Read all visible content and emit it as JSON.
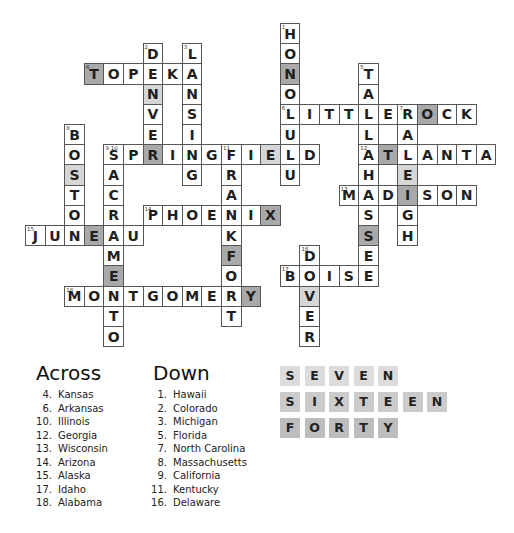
{
  "puzzle": {
    "grid": {
      "origin_x": 25,
      "origin_y": 23,
      "cell_w": 19.6,
      "cell_h": 20.2,
      "shade_colors": {
        "dark": "#a9a9a9",
        "light": "#d6d6d6",
        "none": "#ffffff"
      },
      "cells": [
        {
          "c": 13,
          "r": 0,
          "ch": "H",
          "num": "1"
        },
        {
          "c": 13,
          "r": 1,
          "ch": "O"
        },
        {
          "c": 13,
          "r": 2,
          "ch": "N",
          "shade": "dark"
        },
        {
          "c": 13,
          "r": 3,
          "ch": "O"
        },
        {
          "c": 13,
          "r": 4,
          "ch": "L",
          "num": "6"
        },
        {
          "c": 13,
          "r": 5,
          "ch": "U"
        },
        {
          "c": 13,
          "r": 6,
          "ch": "L"
        },
        {
          "c": 13,
          "r": 7,
          "ch": "U"
        },
        {
          "c": 6,
          "r": 1,
          "ch": "D",
          "num": "2"
        },
        {
          "c": 6,
          "r": 2,
          "ch": "E"
        },
        {
          "c": 6,
          "r": 3,
          "ch": "N",
          "shade": "light"
        },
        {
          "c": 6,
          "r": 4,
          "ch": "V"
        },
        {
          "c": 6,
          "r": 5,
          "ch": "E"
        },
        {
          "c": 6,
          "r": 6,
          "ch": "R",
          "shade": "dark"
        },
        {
          "c": 8,
          "r": 1,
          "ch": "L",
          "num": "3"
        },
        {
          "c": 8,
          "r": 2,
          "ch": "A"
        },
        {
          "c": 8,
          "r": 3,
          "ch": "N"
        },
        {
          "c": 8,
          "r": 4,
          "ch": "S"
        },
        {
          "c": 8,
          "r": 5,
          "ch": "I"
        },
        {
          "c": 8,
          "r": 6,
          "ch": "N"
        },
        {
          "c": 8,
          "r": 7,
          "ch": "G"
        },
        {
          "c": 3,
          "r": 2,
          "ch": "T",
          "num": "4",
          "shade": "dark"
        },
        {
          "c": 4,
          "r": 2,
          "ch": "O"
        },
        {
          "c": 5,
          "r": 2,
          "ch": "P"
        },
        {
          "c": 7,
          "r": 2,
          "ch": "K"
        },
        {
          "c": 17,
          "r": 2,
          "ch": "T",
          "num": "5"
        },
        {
          "c": 17,
          "r": 3,
          "ch": "A"
        },
        {
          "c": 17,
          "r": 4,
          "ch": "L"
        },
        {
          "c": 17,
          "r": 5,
          "ch": "L"
        },
        {
          "c": 17,
          "r": 6,
          "ch": "A",
          "num": "12"
        },
        {
          "c": 17,
          "r": 7,
          "ch": "H"
        },
        {
          "c": 17,
          "r": 8,
          "ch": "A"
        },
        {
          "c": 17,
          "r": 9,
          "ch": "S"
        },
        {
          "c": 17,
          "r": 10,
          "ch": "S",
          "shade": "dark"
        },
        {
          "c": 17,
          "r": 11,
          "ch": "E"
        },
        {
          "c": 17,
          "r": 12,
          "ch": "E"
        },
        {
          "c": 14,
          "r": 4,
          "ch": "I"
        },
        {
          "c": 15,
          "r": 4,
          "ch": "T"
        },
        {
          "c": 16,
          "r": 4,
          "ch": "T"
        },
        {
          "c": 18,
          "r": 4,
          "ch": "E"
        },
        {
          "c": 19,
          "r": 4,
          "ch": "R",
          "num": "7"
        },
        {
          "c": 20,
          "r": 4,
          "ch": "O",
          "shade": "dark"
        },
        {
          "c": 21,
          "r": 4,
          "ch": "C"
        },
        {
          "c": 22,
          "r": 4,
          "ch": "K"
        },
        {
          "c": 19,
          "r": 5,
          "ch": "A"
        },
        {
          "c": 19,
          "r": 6,
          "ch": "L"
        },
        {
          "c": 19,
          "r": 7,
          "ch": "E",
          "shade": "light"
        },
        {
          "c": 19,
          "r": 8,
          "ch": "I",
          "shade": "dark"
        },
        {
          "c": 19,
          "r": 9,
          "ch": "G"
        },
        {
          "c": 19,
          "r": 10,
          "ch": "H"
        },
        {
          "c": 2,
          "r": 5,
          "ch": "B",
          "num": "8"
        },
        {
          "c": 2,
          "r": 6,
          "ch": "O"
        },
        {
          "c": 2,
          "r": 7,
          "ch": "S",
          "shade": "light"
        },
        {
          "c": 2,
          "r": 8,
          "ch": "T"
        },
        {
          "c": 2,
          "r": 9,
          "ch": "O"
        },
        {
          "c": 2,
          "r": 10,
          "ch": "N"
        },
        {
          "c": 4,
          "r": 6,
          "ch": "S",
          "num": "9 10"
        },
        {
          "c": 5,
          "r": 6,
          "ch": "P"
        },
        {
          "c": 7,
          "r": 6,
          "ch": "I"
        },
        {
          "c": 9,
          "r": 6,
          "ch": "G"
        },
        {
          "c": 10,
          "r": 6,
          "ch": "F",
          "num": "11"
        },
        {
          "c": 11,
          "r": 6,
          "ch": "I"
        },
        {
          "c": 12,
          "r": 6,
          "ch": "E",
          "shade": "light"
        },
        {
          "c": 14,
          "r": 6,
          "ch": "D"
        },
        {
          "c": 18,
          "r": 6,
          "ch": "T",
          "shade": "dark"
        },
        {
          "c": 20,
          "r": 6,
          "ch": "A"
        },
        {
          "c": 21,
          "r": 6,
          "ch": "N"
        },
        {
          "c": 22,
          "r": 6,
          "ch": "T"
        },
        {
          "c": 23,
          "r": 6,
          "ch": "A"
        },
        {
          "c": 4,
          "r": 7,
          "ch": "A"
        },
        {
          "c": 4,
          "r": 8,
          "ch": "C"
        },
        {
          "c": 4,
          "r": 9,
          "ch": "R"
        },
        {
          "c": 4,
          "r": 10,
          "ch": "A"
        },
        {
          "c": 4,
          "r": 11,
          "ch": "M"
        },
        {
          "c": 4,
          "r": 12,
          "ch": "E",
          "shade": "dark"
        },
        {
          "c": 4,
          "r": 13,
          "ch": "N"
        },
        {
          "c": 4,
          "r": 14,
          "ch": "T"
        },
        {
          "c": 4,
          "r": 15,
          "ch": "O"
        },
        {
          "c": 10,
          "r": 7,
          "ch": "R"
        },
        {
          "c": 10,
          "r": 8,
          "ch": "A"
        },
        {
          "c": 10,
          "r": 9,
          "ch": "N"
        },
        {
          "c": 10,
          "r": 10,
          "ch": "K"
        },
        {
          "c": 10,
          "r": 11,
          "ch": "F",
          "shade": "dark"
        },
        {
          "c": 10,
          "r": 12,
          "ch": "O"
        },
        {
          "c": 10,
          "r": 13,
          "ch": "R"
        },
        {
          "c": 10,
          "r": 14,
          "ch": "T"
        },
        {
          "c": 16,
          "r": 8,
          "ch": "M",
          "num": "13"
        },
        {
          "c": 18,
          "r": 8,
          "ch": "D"
        },
        {
          "c": 20,
          "r": 8,
          "ch": "S"
        },
        {
          "c": 21,
          "r": 8,
          "ch": "O"
        },
        {
          "c": 22,
          "r": 8,
          "ch": "N"
        },
        {
          "c": 6,
          "r": 9,
          "ch": "P",
          "num": "14"
        },
        {
          "c": 7,
          "r": 9,
          "ch": "H"
        },
        {
          "c": 8,
          "r": 9,
          "ch": "O"
        },
        {
          "c": 9,
          "r": 9,
          "ch": "E"
        },
        {
          "c": 11,
          "r": 9,
          "ch": "I"
        },
        {
          "c": 12,
          "r": 9,
          "ch": "X",
          "shade": "dark"
        },
        {
          "c": 0,
          "r": 10,
          "ch": "J",
          "num": "15"
        },
        {
          "c": 1,
          "r": 10,
          "ch": "U"
        },
        {
          "c": 3,
          "r": 10,
          "ch": "E",
          "shade": "dark"
        },
        {
          "c": 5,
          "r": 10,
          "ch": "U"
        },
        {
          "c": 14,
          "r": 11,
          "ch": "D",
          "num": "16"
        },
        {
          "c": 14,
          "r": 12,
          "ch": "O"
        },
        {
          "c": 14,
          "r": 13,
          "ch": "V",
          "shade": "light"
        },
        {
          "c": 14,
          "r": 14,
          "ch": "E"
        },
        {
          "c": 14,
          "r": 15,
          "ch": "R"
        },
        {
          "c": 13,
          "r": 12,
          "ch": "B",
          "num": "17"
        },
        {
          "c": 15,
          "r": 12,
          "ch": "I"
        },
        {
          "c": 16,
          "r": 12,
          "ch": "S"
        },
        {
          "c": 2,
          "r": 13,
          "ch": "M",
          "num": "18"
        },
        {
          "c": 3,
          "r": 13,
          "ch": "O"
        },
        {
          "c": 5,
          "r": 13,
          "ch": "T"
        },
        {
          "c": 6,
          "r": 13,
          "ch": "G"
        },
        {
          "c": 7,
          "r": 13,
          "ch": "O"
        },
        {
          "c": 8,
          "r": 13,
          "ch": "M"
        },
        {
          "c": 9,
          "r": 13,
          "ch": "E"
        },
        {
          "c": 11,
          "r": 13,
          "ch": "Y",
          "shade": "dark"
        }
      ]
    },
    "across": {
      "heading": "Across",
      "clues": [
        {
          "n": "4.",
          "text": "Kansas"
        },
        {
          "n": "6.",
          "text": "Arkansas"
        },
        {
          "n": "10.",
          "text": "Illinois"
        },
        {
          "n": "12.",
          "text": "Georgia"
        },
        {
          "n": "13.",
          "text": "Wisconsin"
        },
        {
          "n": "14.",
          "text": "Arizona"
        },
        {
          "n": "15.",
          "text": "Alaska"
        },
        {
          "n": "17.",
          "text": "Idaho"
        },
        {
          "n": "18.",
          "text": "Alabama"
        }
      ]
    },
    "down": {
      "heading": "Down",
      "clues": [
        {
          "n": "1.",
          "text": "Hawaii"
        },
        {
          "n": "2.",
          "text": "Colorado"
        },
        {
          "n": "3.",
          "text": "Michigan"
        },
        {
          "n": "5.",
          "text": "Florida"
        },
        {
          "n": "7.",
          "text": "North Carolina"
        },
        {
          "n": "8.",
          "text": "Massachusetts"
        },
        {
          "n": "9.",
          "text": "California"
        },
        {
          "n": "11.",
          "text": "Kentucky"
        },
        {
          "n": "16.",
          "text": "Delaware"
        }
      ]
    },
    "answer_tiles": [
      {
        "word": "SEVEN",
        "color": "#dcdcdc"
      },
      {
        "word": "SIXTEEN",
        "color": "#cbcbcb"
      },
      {
        "word": "FORTY",
        "color": "#bdbdbd"
      }
    ]
  }
}
